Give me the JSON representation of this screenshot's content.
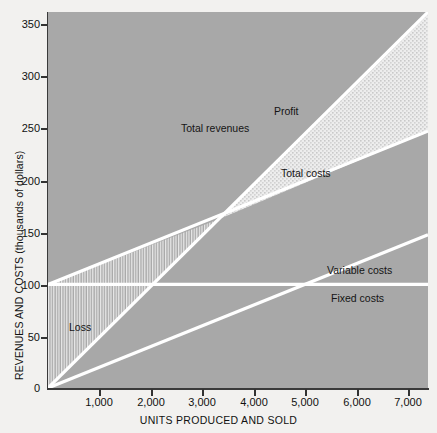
{
  "chart_data": {
    "type": "line",
    "title": "",
    "xlabel": "UNITS PRODUCED AND SOLD",
    "ylabel": "REVENUES AND COSTS (thousands of dollars)",
    "xlim": [
      0,
      7350
    ],
    "ylim": [
      0,
      363
    ],
    "grid": false,
    "legend_position": "inline-annotations",
    "xticks": [
      {
        "value": 1000,
        "label": "1,000"
      },
      {
        "value": 2000,
        "label": "2,000"
      },
      {
        "value": 3000,
        "label": "3,000"
      },
      {
        "value": 4000,
        "label": "4,000"
      },
      {
        "value": 5000,
        "label": "5,000"
      },
      {
        "value": 6000,
        "label": "6,000"
      },
      {
        "value": 7000,
        "label": "7,000"
      }
    ],
    "yticks": [
      {
        "value": 0,
        "label": "0"
      },
      {
        "value": 50,
        "label": "50"
      },
      {
        "value": 100,
        "label": "100"
      },
      {
        "value": 150,
        "label": "150"
      },
      {
        "value": 200,
        "label": "200"
      },
      {
        "value": 250,
        "label": "250"
      },
      {
        "value": 300,
        "label": "300"
      },
      {
        "value": 350,
        "label": "350"
      }
    ],
    "series": [
      {
        "name": "Total revenues",
        "label": "Total revenues",
        "x": [
          0,
          7350
        ],
        "values": [
          0,
          363
        ],
        "slope_per_unit": 0.0494,
        "intercept": 0
      },
      {
        "name": "Total costs",
        "label": "Total costs",
        "x": [
          0,
          7350
        ],
        "values": [
          100,
          248
        ],
        "slope_per_unit": 0.0201,
        "intercept": 100
      },
      {
        "name": "Variable costs",
        "label": "Variable costs",
        "x": [
          0,
          7350
        ],
        "values": [
          0,
          148
        ],
        "slope_per_unit": 0.0201,
        "intercept": 0
      },
      {
        "name": "Fixed costs",
        "label": "Fixed costs",
        "x": [
          0,
          7350
        ],
        "values": [
          100,
          100
        ],
        "slope_per_unit": 0,
        "intercept": 100
      }
    ],
    "regions": [
      {
        "name": "Loss",
        "label": "Loss",
        "fill": "vertical-hatch",
        "label_x": 620,
        "label_y": 63
      },
      {
        "name": "Profit",
        "label": "Profit",
        "fill": "stipple",
        "label_x": 6090,
        "label_y": 288
      }
    ],
    "annotations": [
      {
        "name": "break-even-point",
        "x": 3300,
        "y": 163
      }
    ],
    "colors": {
      "plot_background": "#a8a8a8",
      "page_background": "#f2f1ef",
      "line": "#ffffff",
      "text": "#111111",
      "axis": "#3a3a3a",
      "profit_fill": "#e9e9e9",
      "loss_fill": "#e2e2e2"
    }
  }
}
